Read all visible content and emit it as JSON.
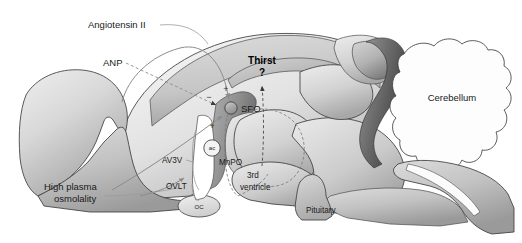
{
  "figure": {
    "width": 522,
    "height": 243,
    "background": "#ffffff"
  },
  "colors": {
    "outline": "#3d3d3d",
    "text": "#1a1a1a",
    "arrow": "#8c8c8c",
    "arrow_dark": "#4a4a4a",
    "leader": "#9a9a9a",
    "fill_light": "#f2f2f2",
    "fill_mid": "#c9c9c9",
    "fill_dark": "#8f8f8f",
    "fill_darkest": "#4f4f4f",
    "white": "#ffffff"
  },
  "labels": {
    "angiotensin": "Angiotensin II",
    "anp": "ANP",
    "thirst": "Thirst",
    "question": "?",
    "sfo": "SFO",
    "cerebellum": "Cerebellum",
    "av3v": "AV3V",
    "mnpo": "MnPO",
    "ovlt": "OVLT",
    "oc": "OC",
    "ac": "ac",
    "ventricle_line1": "3rd",
    "ventricle_line2": "ventricle",
    "pituitary": "Pituitary",
    "osmolality_line1": "High plasma",
    "osmolality_line2": "osmolality"
  },
  "signs": {
    "plus_angiotensin": "+",
    "minus_anp": "−",
    "plus_osmolality": "+"
  },
  "structures": [
    {
      "name": "cortex-left",
      "label": ""
    },
    {
      "name": "cerebral-cortex",
      "label": ""
    },
    {
      "name": "subfornical-organ",
      "label": "SFO"
    },
    {
      "name": "median-preoptic-nucleus",
      "label": "MnPO"
    },
    {
      "name": "organum-vasculosum",
      "label": "OVLT"
    },
    {
      "name": "optic-chiasm",
      "label": "OC"
    },
    {
      "name": "anterior-commissure",
      "label": "ac"
    },
    {
      "name": "third-ventricle",
      "label": "3rd ventricle"
    },
    {
      "name": "pituitary-gland",
      "label": "Pituitary"
    },
    {
      "name": "cerebellum",
      "label": "Cerebellum"
    },
    {
      "name": "brainstem",
      "label": ""
    },
    {
      "name": "thalamus",
      "label": ""
    }
  ],
  "pathways": [
    {
      "name": "angiotensin-to-sfo",
      "from": "Angiotensin II",
      "to": "SFO",
      "sign": "+",
      "style": "solid"
    },
    {
      "name": "anp-to-sfo",
      "from": "ANP",
      "to": "SFO",
      "sign": "−",
      "style": "dashed"
    },
    {
      "name": "osmolality-to-sfo",
      "from": "High plasma osmolality",
      "to": "SFO",
      "sign": "+",
      "style": "solid"
    },
    {
      "name": "osmolality-to-ovlt",
      "from": "High plasma osmolality",
      "to": "OVLT",
      "sign": "",
      "style": "solid"
    },
    {
      "name": "sfo-to-thirst",
      "from": "SFO",
      "to": "Thirst",
      "sign": "",
      "style": "dashed"
    }
  ]
}
